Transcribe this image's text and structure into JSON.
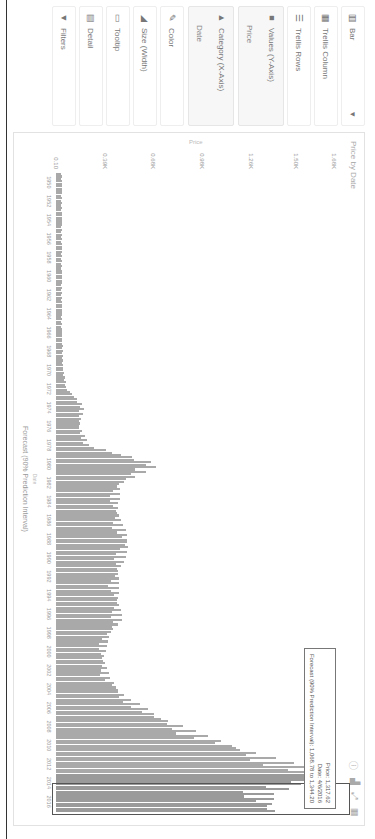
{
  "sidebar": {
    "chart_type": {
      "label": "Bar",
      "icon": "bar-chart-icon"
    },
    "items": [
      {
        "label": "Trellis Column",
        "icon": "trellis-column-icon"
      },
      {
        "label": "Trellis Rows",
        "icon": "trellis-rows-icon"
      }
    ],
    "values_group": {
      "label": "Values (Y-Axis)",
      "field": "Price"
    },
    "category_group": {
      "label": "Category (X-Axis)",
      "field": "Date"
    },
    "encodings": [
      {
        "label": "Color",
        "icon": "color-icon"
      },
      {
        "label": "Size (Width)",
        "icon": "size-icon"
      },
      {
        "label": "Tooltip",
        "icon": "tooltip-icon"
      },
      {
        "label": "Detail",
        "icon": "detail-icon"
      },
      {
        "label": "Filters",
        "icon": "filter-icon"
      }
    ]
  },
  "chart": {
    "title": "Price by Date",
    "toolbar": [
      "info-icon",
      "chart-type-icon",
      "expand-icon",
      "table-icon"
    ],
    "y_axis_title": "Price",
    "x_axis_title": "Forecast (90% Prediction Interval)",
    "x_axis_sub": "Date",
    "tooltip": {
      "price": "Price: 1,317.62",
      "date": "Date: 4/6/2016",
      "forecast": "Forecast (90% Prediction Interval): 1,068.78 to 1,344.20"
    }
  },
  "chart_data": {
    "type": "bar",
    "title": "Price by Date",
    "xlabel": "Date",
    "ylabel": "Price",
    "legend": "Forecast (90% Prediction Interval)",
    "y_ticks": [
      "0.10",
      "0.39K",
      "0.68K",
      "0.98K",
      "1.26K",
      "1.50K",
      "1.68K"
    ],
    "ylim": [
      0,
      1800
    ],
    "x_ticks": [
      "1950",
      "1952",
      "1954",
      "1956",
      "1958",
      "1960",
      "1962",
      "1964",
      "1966",
      "1968",
      "1970",
      "1972",
      "1974",
      "1976",
      "1978",
      "1980",
      "1982",
      "1984",
      "1986",
      "1988",
      "1990",
      "1992",
      "1994",
      "1996",
      "1998",
      "2000",
      "2002",
      "2004",
      "2006",
      "2008",
      "2010",
      "2012",
      "2014",
      "2016"
    ],
    "series": [
      {
        "name": "Price (approx. yearly level)",
        "categories": [
          "1950",
          "1952",
          "1954",
          "1956",
          "1958",
          "1960",
          "1962",
          "1964",
          "1966",
          "1968",
          "1970",
          "1972",
          "1974",
          "1976",
          "1978",
          "1980",
          "1982",
          "1984",
          "1986",
          "1988",
          "1990",
          "1992",
          "1994",
          "1996",
          "1998",
          "2000",
          "2002",
          "2004",
          "2006",
          "2008",
          "2010",
          "2012",
          "2014",
          "2016"
        ],
        "values": [
          35,
          35,
          35,
          35,
          35,
          35,
          35,
          35,
          35,
          38,
          40,
          60,
          160,
          140,
          190,
          600,
          380,
          360,
          380,
          430,
          390,
          360,
          370,
          380,
          300,
          280,
          310,
          410,
          600,
          870,
          1220,
          1600,
          1250,
          1300
        ]
      }
    ],
    "tooltip": {
      "price": 1317.62,
      "date": "4/6/2016",
      "forecast_low": 1068.78,
      "forecast_high": 1344.2
    },
    "grid": false
  }
}
